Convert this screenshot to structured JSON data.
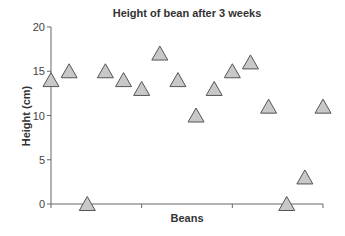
{
  "chart_data": {
    "type": "scatter",
    "title": "Height of bean after 3 weeks",
    "xlabel": "Beans",
    "ylabel": "Height (cm)",
    "ylim": [
      0,
      20
    ],
    "yticks": [
      0,
      5,
      10,
      15,
      20
    ],
    "xticks_count": 4,
    "grid": false,
    "legend": null,
    "marker": "triangle",
    "marker_color": "#c8c8c8",
    "marker_edge": "#555555",
    "x": [
      1,
      2,
      3,
      4,
      5,
      6,
      7,
      8,
      9,
      10,
      11,
      12,
      13,
      14,
      15,
      16
    ],
    "values": [
      14,
      15,
      0,
      15,
      14,
      13,
      17,
      14,
      10,
      13,
      15,
      16,
      11,
      0,
      3,
      11
    ]
  }
}
